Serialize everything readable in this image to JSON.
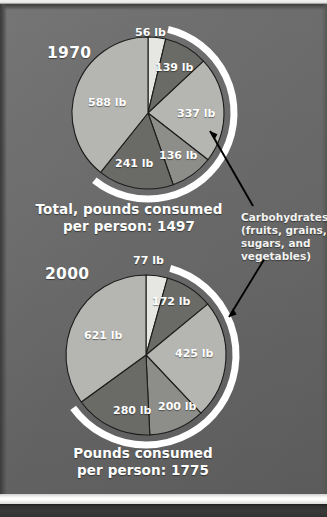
{
  "figure": {
    "background_color": "#686868",
    "separator_color": "#ffffff",
    "bottom_strip_color": "#323232"
  },
  "palette": {
    "slice_lightest": "#e6e6e2",
    "slice_light": "#b5b5b1",
    "slice_medium": "#8d8d89",
    "slice_dark": "#6a6a66",
    "outline": "#1c1c1c",
    "highlight_arc": "#ffffff",
    "leader_line": "#000000",
    "label_text": "#ffffff"
  },
  "annotation": {
    "name": "carbohydrates-callout",
    "lines": [
      "Carbohydrates",
      "(fruits, grains,",
      "sugars, and",
      "vegetables)"
    ],
    "text": "Carbohydrates (fruits, grains, sugars, and vegetables)"
  },
  "charts": [
    {
      "id": "pie-1970",
      "year_label": "1970",
      "caption_lines": [
        "Total, pounds consumed",
        "per person: 1497"
      ],
      "caption": "Total, pounds consumed per person: 1497",
      "total_label": "1497",
      "unit": "lb"
    },
    {
      "id": "pie-2000",
      "year_label": "2000",
      "caption_lines": [
        "Pounds consumed",
        "per person: 1775"
      ],
      "caption": "Pounds consumed per person: 1775",
      "total_label": "1775",
      "unit": "lb"
    }
  ],
  "chart_data": [
    {
      "type": "pie",
      "id": "pie-1970",
      "title": "1970",
      "subtitle": "Total, pounds consumed per person: 1497",
      "unit": "lb",
      "total": 1497,
      "legend": "none",
      "grid": false,
      "start_angle_deg": 0,
      "direction": "clockwise",
      "categories": [
        "56 lb",
        "139 lb",
        "337 lb",
        "136 lb",
        "241 lb",
        "588 lb"
      ],
      "values": [
        56,
        139,
        337,
        136,
        241,
        588
      ],
      "labels": [
        "56 lb",
        "139 lb",
        "337 lb",
        "136 lb",
        "241 lb",
        "588 lb"
      ],
      "colors": [
        "#e6e6e2",
        "#6a6a66",
        "#b5b5b1",
        "#8d8d89",
        "#6a6a66",
        "#b5b5b1"
      ],
      "highlight_arc": {
        "label": "Carbohydrates",
        "slices": [
          "139 lb",
          "337 lb",
          "136 lb",
          "241 lb"
        ],
        "sum": 853
      }
    },
    {
      "type": "pie",
      "id": "pie-2000",
      "title": "2000",
      "subtitle": "Pounds consumed per person: 1775",
      "unit": "lb",
      "total": 1775,
      "legend": "none",
      "grid": false,
      "start_angle_deg": 0,
      "direction": "clockwise",
      "categories": [
        "77 lb",
        "172 lb",
        "425 lb",
        "200 lb",
        "280 lb",
        "621 lb"
      ],
      "values": [
        77,
        172,
        425,
        200,
        280,
        621
      ],
      "labels": [
        "77 lb",
        "172 lb",
        "425 lb",
        "200 lb",
        "280 lb",
        "621 lb"
      ],
      "colors": [
        "#e6e6e2",
        "#6a6a66",
        "#b5b5b1",
        "#8d8d89",
        "#6a6a66",
        "#b5b5b1"
      ],
      "highlight_arc": {
        "label": "Carbohydrates",
        "slices": [
          "172 lb",
          "425 lb",
          "200 lb",
          "280 lb"
        ],
        "sum": 1077
      }
    }
  ]
}
